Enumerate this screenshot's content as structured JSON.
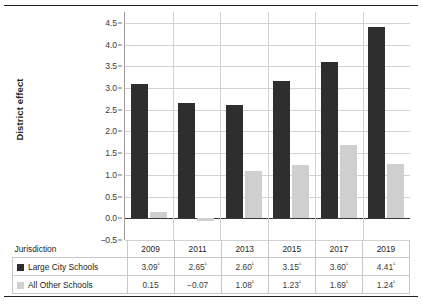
{
  "chart_data": {
    "type": "bar",
    "title": "",
    "xlabel": "",
    "ylabel": "District effect",
    "ylim": [
      -0.5,
      4.75
    ],
    "yticks": [
      "4.5",
      "4.0",
      "3.5",
      "3.0",
      "2.5",
      "2.0",
      "1.5",
      "1.0",
      "0.5",
      "0.0",
      "−0.5"
    ],
    "ytick_values": [
      4.5,
      4.0,
      3.5,
      3.0,
      2.5,
      2.0,
      1.5,
      1.0,
      0.5,
      0.0,
      -0.5
    ],
    "grid": true,
    "legend_position": "table-below",
    "categories": [
      "2009",
      "2011",
      "2013",
      "2015",
      "2017",
      "2019"
    ],
    "series": [
      {
        "name": "Large City Schools",
        "color": "#2e2e2e",
        "values": [
          3.09,
          2.65,
          2.6,
          3.15,
          3.6,
          4.41
        ],
        "labels": [
          "3.09",
          "2.65",
          "2.60",
          "3.15",
          "3.60",
          "4.41"
        ],
        "markers": [
          "¹",
          "¹",
          "¹",
          "¹",
          "¹",
          "¹"
        ]
      },
      {
        "name": "All Other Schools",
        "color": "#cfcfcf",
        "values": [
          0.15,
          -0.07,
          1.08,
          1.23,
          1.69,
          1.24
        ],
        "labels": [
          "0.15",
          "−0.07",
          "1.08",
          "1.23",
          "1.69",
          "1.24"
        ],
        "markers": [
          "",
          "",
          "¹",
          "¹",
          "¹",
          "¹"
        ]
      }
    ]
  },
  "table": {
    "jurisdiction_header": "Jurisdiction",
    "years": [
      "2009",
      "2011",
      "2013",
      "2015",
      "2017",
      "2019"
    ],
    "rows": [
      {
        "label": "Large City Schools",
        "swatch_color": "#2e2e2e",
        "values": [
          "3.09",
          "2.65",
          "2.60",
          "3.15",
          "3.60",
          "4.41"
        ],
        "markers": [
          "¹",
          "¹",
          "¹",
          "¹",
          "¹",
          "¹"
        ]
      },
      {
        "label": "All Other Schools",
        "swatch_color": "#cfcfcf",
        "values": [
          "0.15",
          "−0.07",
          "1.08",
          "1.23",
          "1.69",
          "1.24"
        ],
        "markers": [
          "",
          "",
          "¹",
          "¹",
          "¹",
          "¹"
        ]
      }
    ]
  },
  "colors": {
    "large_city": "#2e2e2e",
    "all_other": "#cfcfcf",
    "grid": "#d2d2d2",
    "axis": "#3a3a3a",
    "rule": "#231f20"
  }
}
